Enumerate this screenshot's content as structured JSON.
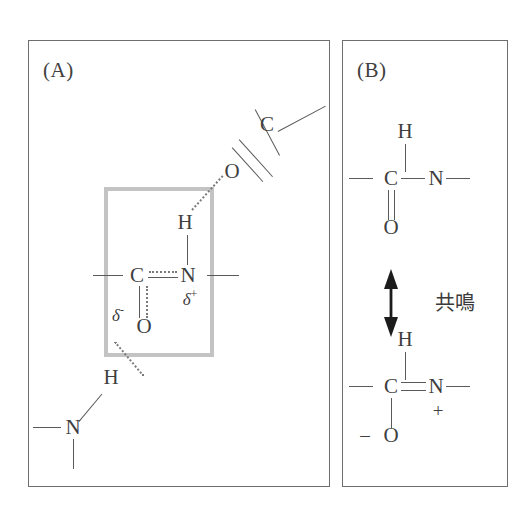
{
  "figure": {
    "width": 522,
    "height": 527,
    "background": "#ffffff",
    "ink_color": "#3f3f3f",
    "highlight_color": "#c3c3c3"
  },
  "panels": {
    "a": {
      "label": "(A)",
      "caption_note": "hydrogen-bonded peptide bond with partial charges",
      "atoms": [
        {
          "name": "carbonyl-carbon-top",
          "symbol": "C",
          "x": 266,
          "y": 123
        },
        {
          "name": "carbonyl-oxygen-top",
          "symbol": "O",
          "x": 231,
          "y": 170
        },
        {
          "name": "amide-hydrogen",
          "symbol": "H",
          "x": 184,
          "y": 221
        },
        {
          "name": "amide-carbon",
          "symbol": "C",
          "x": 136,
          "y": 274
        },
        {
          "name": "amide-nitrogen",
          "symbol": "N",
          "x": 187,
          "y": 274
        },
        {
          "name": "carbonyl-oxygen-center",
          "symbol": "O",
          "x": 143,
          "y": 325
        },
        {
          "name": "donor-hydrogen",
          "symbol": "H",
          "x": 110,
          "y": 376
        },
        {
          "name": "donor-nitrogen",
          "symbol": "N",
          "x": 72,
          "y": 426
        }
      ],
      "charges": [
        {
          "name": "delta-plus-nitrogen",
          "text": "δ",
          "sup": "+",
          "x": 189,
          "y": 297
        },
        {
          "name": "delta-minus-oxygen",
          "text": "δ",
          "sup": "-",
          "x": 117,
          "y": 313
        }
      ],
      "highlight_box": {
        "x": 103,
        "y": 186,
        "width": 110,
        "height": 170
      }
    },
    "b": {
      "label": "(B)",
      "resonance_label": "共鳴",
      "top_structure": {
        "atoms": [
          {
            "name": "amide-hydrogen-top",
            "symbol": "H",
            "x": 404,
            "y": 130
          },
          {
            "name": "amide-carbon-top",
            "symbol": "C",
            "x": 390,
            "y": 177
          },
          {
            "name": "amide-nitrogen-top",
            "symbol": "N",
            "x": 435,
            "y": 177
          },
          {
            "name": "carbonyl-oxygen-top",
            "symbol": "O",
            "x": 390,
            "y": 226
          }
        ]
      },
      "bottom_structure": {
        "atoms": [
          {
            "name": "amide-hydrogen-bottom",
            "symbol": "H",
            "x": 404,
            "y": 338
          },
          {
            "name": "amide-carbon-bottom",
            "symbol": "C",
            "x": 390,
            "y": 385
          },
          {
            "name": "amide-nitrogen-bottom",
            "symbol": "N",
            "x": 435,
            "y": 385
          },
          {
            "name": "oxide-oxygen-bottom",
            "symbol": "O",
            "x": 390,
            "y": 434
          }
        ],
        "charges": [
          {
            "name": "formal-plus-nitrogen",
            "text": "+",
            "x": 437,
            "y": 409
          },
          {
            "name": "formal-minus-oxygen",
            "text": "–",
            "x": 364,
            "y": 433
          }
        ]
      }
    }
  }
}
